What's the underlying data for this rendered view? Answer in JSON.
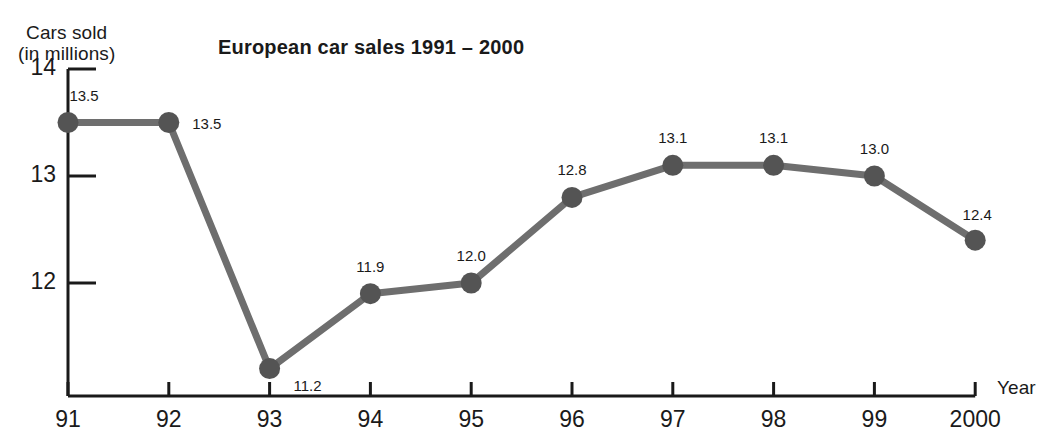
{
  "chart_data": {
    "type": "line",
    "title": "European car sales 1991 – 2000",
    "xlabel": "Year",
    "ylabel": "Cars sold (in millions)",
    "ylabel_line1": "Cars sold",
    "ylabel_line2": "(in millions)",
    "categories": [
      "91",
      "92",
      "93",
      "94",
      "95",
      "96",
      "97",
      "98",
      "99",
      "2000"
    ],
    "values": [
      13.5,
      13.5,
      11.2,
      11.9,
      12.0,
      12.8,
      13.1,
      13.1,
      13.0,
      12.4
    ],
    "point_labels": [
      "13.5",
      "13.5",
      "11.2",
      "11.9",
      "12.0",
      "12.8",
      "13.1",
      "13.1",
      "13.0",
      "12.4"
    ],
    "yticks": [
      14,
      13,
      12
    ],
    "ytick_labels": [
      "14",
      "13",
      "12"
    ],
    "ylim": [
      11.0,
      14.0
    ],
    "grid": false,
    "legend": false,
    "series_color": "#6e6e6e",
    "marker_color": "#545454",
    "axis_color": "#1a1a1a"
  }
}
